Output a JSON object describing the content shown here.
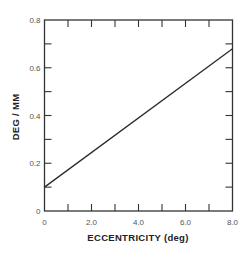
{
  "chart_data": {
    "type": "line",
    "title": "",
    "xlabel": "ECCENTRICITY (deg)",
    "ylabel": "DEG / MM",
    "xlim": [
      0,
      8
    ],
    "ylim": [
      0,
      0.8
    ],
    "x_ticks": [
      0,
      2,
      4,
      6,
      8
    ],
    "x_tick_labels": [
      "0",
      "2.0",
      "4.0",
      "6.0",
      "8.0"
    ],
    "x_minor_ticks": [
      1,
      3,
      5,
      7
    ],
    "y_ticks": [
      0,
      0.2,
      0.4,
      0.6,
      0.8
    ],
    "y_tick_labels": [
      "0",
      "0.2",
      "0.4",
      "0.6",
      "0.8"
    ],
    "y_minor_ticks": [
      0.1,
      0.3,
      0.5,
      0.7
    ],
    "grid": false,
    "legend": "none",
    "series": [
      {
        "name": "deg/mm vs eccentricity",
        "x": [
          0,
          8
        ],
        "y": [
          0.1,
          0.68
        ]
      }
    ]
  }
}
